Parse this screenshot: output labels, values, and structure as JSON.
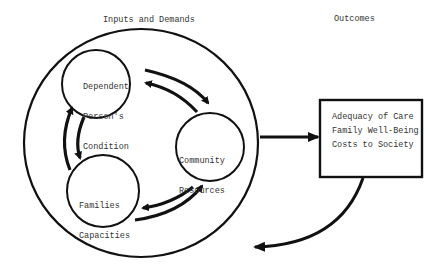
{
  "headers": {
    "inputs": "Inputs and Demands",
    "outcomes": "Outcomes"
  },
  "nodes": {
    "dependent": {
      "line1": "Dependent",
      "line2": "Person's",
      "line3": "Condition"
    },
    "community": {
      "line1": "Community",
      "line2": "Resources"
    },
    "families": {
      "line1": "Families",
      "line2": "Capacities"
    }
  },
  "outcomes_box": {
    "items": [
      "Adequacy of Care",
      "Family Well-Being",
      "Costs to Society"
    ]
  },
  "edges": [
    {
      "from": "dependent",
      "to": "community",
      "type": "bidirectional"
    },
    {
      "from": "community",
      "to": "families",
      "type": "bidirectional"
    },
    {
      "from": "families",
      "to": "dependent",
      "type": "bidirectional"
    },
    {
      "from": "inputs-and-demands",
      "to": "outcomes",
      "type": "arrow"
    },
    {
      "from": "outcomes",
      "to": "inputs-and-demands",
      "type": "feedback-arrow"
    }
  ],
  "colors": {
    "stroke": "#111111",
    "text": "#333333",
    "background": "#ffffff"
  }
}
